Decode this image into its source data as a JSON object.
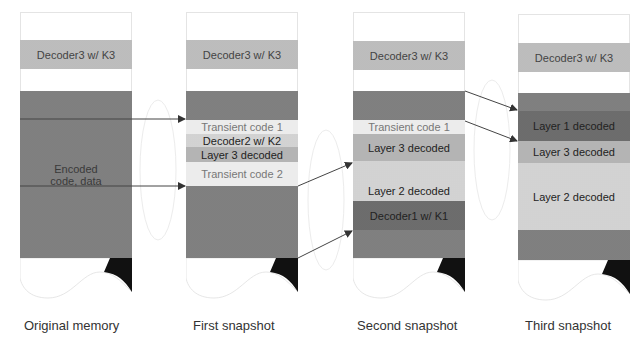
{
  "diagram": {
    "columns": [
      {
        "caption": "Original memory",
        "top_block": "Decoder3 w/ K3",
        "blocks": [
          {
            "label": "Encoded\ncode, data",
            "shade": "dark"
          }
        ]
      },
      {
        "caption": "First snapshot",
        "top_block": "Decoder3 w/ K3",
        "blocks": [
          {
            "label": "",
            "shade": "dark"
          },
          {
            "label": "Transient code 1",
            "shade": "pale"
          },
          {
            "label": "Decoder2 w/ K2",
            "shade": "light"
          },
          {
            "label": "Layer 3 decoded",
            "shade": "mid"
          },
          {
            "label": "Transient code 2",
            "shade": "pale"
          },
          {
            "label": "",
            "shade": "dark"
          }
        ]
      },
      {
        "caption": "Second snapshot",
        "top_block": "Decoder3 w/ K3",
        "blocks": [
          {
            "label": "",
            "shade": "dark"
          },
          {
            "label": "Transient code 1",
            "shade": "pale"
          },
          {
            "label": "Layer 3 decoded",
            "shade": "mid"
          },
          {
            "label": "",
            "shade": "light"
          },
          {
            "label": "Layer 2 decoded",
            "shade": "light"
          },
          {
            "label": "Decoder1 w/ K1",
            "shade": "darker"
          },
          {
            "label": "",
            "shade": "dark"
          }
        ]
      },
      {
        "caption": "Third snapshot",
        "top_block": "Decoder3 w/ K3",
        "blocks": [
          {
            "label": "",
            "shade": "dark"
          },
          {
            "label": "Layer 1 decoded",
            "shade": "darker"
          },
          {
            "label": "Layer 3 decoded",
            "shade": "mid"
          },
          {
            "label": "Layer 2 decoded",
            "shade": "light"
          },
          {
            "label": "",
            "shade": "dark"
          }
        ]
      }
    ],
    "arrows": [
      {
        "from": "Original memory",
        "to": "First snapshot",
        "target": "Transient code 1"
      },
      {
        "from": "Original memory",
        "to": "First snapshot",
        "target": "Transient code 2"
      },
      {
        "from": "First snapshot",
        "to": "Second snapshot",
        "target": "Layer 3 decoded"
      },
      {
        "from": "First snapshot",
        "to": "Second snapshot",
        "target": "Decoder1 w/ K1"
      },
      {
        "from": "Second snapshot",
        "to": "Third snapshot",
        "target": "Layer 1 decoded (top)"
      },
      {
        "from": "Second snapshot",
        "to": "Third snapshot",
        "target": "Layer 1 decoded (bottom)"
      }
    ]
  }
}
